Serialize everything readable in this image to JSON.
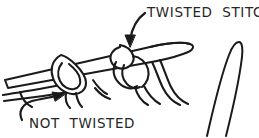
{
  "figure": {
    "kind": "line-drawing",
    "background_color": "#ffffff",
    "ink_color": "#1a1a1a",
    "text_color": "#262626",
    "labels": {
      "twisted": "TWISTED  STITCH",
      "not_twisted": "NOT  TWISTED"
    },
    "annotations": [
      {
        "name": "twisted-stitch-callout",
        "text": "TWISTED  STITCH",
        "text_x": 147,
        "text_y": 17,
        "arrow_from": [
          145,
          14
        ],
        "arrow_to": [
          130,
          47
        ]
      },
      {
        "name": "not-twisted-callout",
        "text": "NOT  TWISTED",
        "text_x": 29,
        "text_y": 128,
        "arrow_from": [
          26,
          118
        ],
        "arrow_to": [
          63,
          95
        ]
      }
    ],
    "parts": [
      "main-needle-shaft",
      "main-needle-tip",
      "untwisted-stitch-loop",
      "twisted-stitch-loop",
      "yarn-strands",
      "second-needle-tip"
    ]
  }
}
